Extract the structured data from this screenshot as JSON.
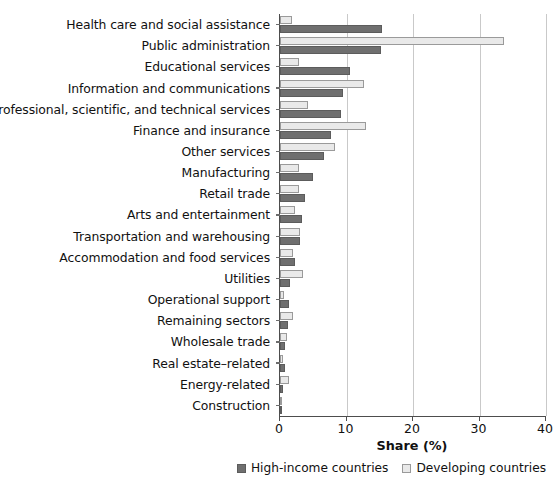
{
  "chart_data": {
    "type": "bar",
    "orientation": "horizontal",
    "title": "",
    "xlabel": "Share (%)",
    "ylabel": "",
    "xlim": [
      0,
      40
    ],
    "xticks": [
      0,
      10,
      20,
      30,
      40
    ],
    "xticklabels": [
      "0",
      "10",
      "20",
      "30",
      "40"
    ],
    "grid": "vertical",
    "legend_position": "bottom-right",
    "categories": [
      "Health care and social assistance",
      "Public administration",
      "Educational services",
      "Information and communications",
      "Professional, scientific, and technical services",
      "Finance and insurance",
      "Other services",
      "Manufacturing",
      "Retail trade",
      "Arts and entertainment",
      "Transportation and warehousing",
      "Accommodation and food services",
      "Utilities",
      "Operational support",
      "Remaining sectors",
      "Wholesale trade",
      "Real estate–related",
      "Energy-related",
      "Construction"
    ],
    "series": [
      {
        "name": "High-income countries",
        "color": "#6f6f6f",
        "values": [
          15.3,
          15.2,
          10.6,
          9.4,
          9.2,
          7.6,
          6.6,
          4.9,
          3.8,
          3.3,
          3.0,
          2.3,
          1.5,
          1.4,
          1.2,
          0.8,
          0.7,
          0.4,
          0.2
        ]
      },
      {
        "name": "Developing countries",
        "color": "#e9e9e9",
        "values": [
          1.8,
          33.7,
          2.8,
          12.7,
          4.2,
          12.9,
          8.2,
          2.9,
          2.9,
          2.2,
          3.0,
          1.9,
          3.5,
          0.6,
          2.0,
          1.0,
          0.5,
          1.3,
          0.3
        ]
      }
    ]
  },
  "legend": {
    "items": [
      {
        "label": "High-income countries",
        "swatch": "dark"
      },
      {
        "label": "Developing countries",
        "swatch": "light"
      }
    ]
  }
}
